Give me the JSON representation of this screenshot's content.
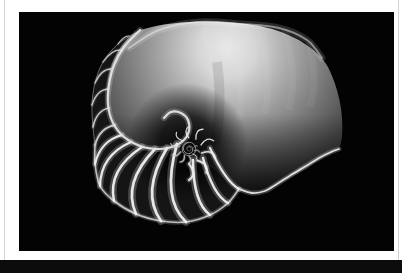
{
  "figure": {
    "alt": "Chambered nautilus shell cross-section photograph"
  },
  "colors": {
    "page_bg": "#ffffff",
    "hairline": "#d2d2d2",
    "photo_bg": "#030303",
    "bar": "#0c0c0c",
    "shell_bright": "#e6e6e6",
    "shell_mid": "#9a9a9a",
    "band_fill": "#151515",
    "septa_upper": "#cdcdcd",
    "septa_lower": "#f4f4f4",
    "glow": "#ffffff"
  }
}
